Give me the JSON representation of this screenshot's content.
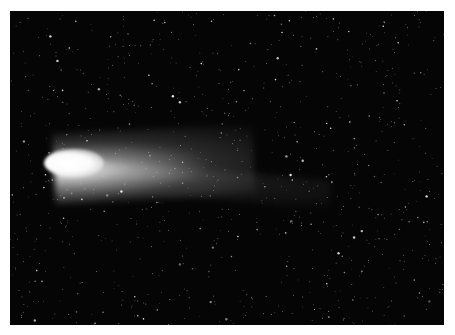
{
  "image": {
    "subject": "comet with bright nucleus and long tail against star field",
    "colors": {
      "border": "#ffffff",
      "sky": "#050505",
      "coma": "#ffffff",
      "stars": "#e8e8e8"
    }
  }
}
